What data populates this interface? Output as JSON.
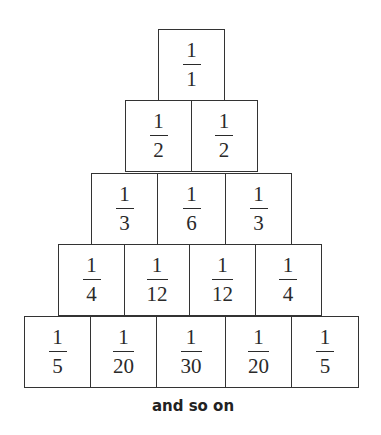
{
  "rows": [
    [
      {
        "num": "1",
        "den": "1"
      }
    ],
    [
      {
        "num": "1",
        "den": "2"
      },
      {
        "num": "1",
        "den": "2"
      }
    ],
    [
      {
        "num": "1",
        "den": "3"
      },
      {
        "num": "1",
        "den": "6"
      },
      {
        "num": "1",
        "den": "3"
      }
    ],
    [
      {
        "num": "1",
        "den": "4"
      },
      {
        "num": "1",
        "den": "12"
      },
      {
        "num": "1",
        "den": "12"
      },
      {
        "num": "1",
        "den": "4"
      }
    ],
    [
      {
        "num": "1",
        "den": "5"
      },
      {
        "num": "1",
        "den": "20"
      },
      {
        "num": "1",
        "den": "30"
      },
      {
        "num": "1",
        "den": "20"
      },
      {
        "num": "1",
        "den": "5"
      }
    ]
  ],
  "caption": "and so on",
  "colors": {
    "line": "#333333",
    "text": "#2a2a2a",
    "background": "#ffffff"
  }
}
